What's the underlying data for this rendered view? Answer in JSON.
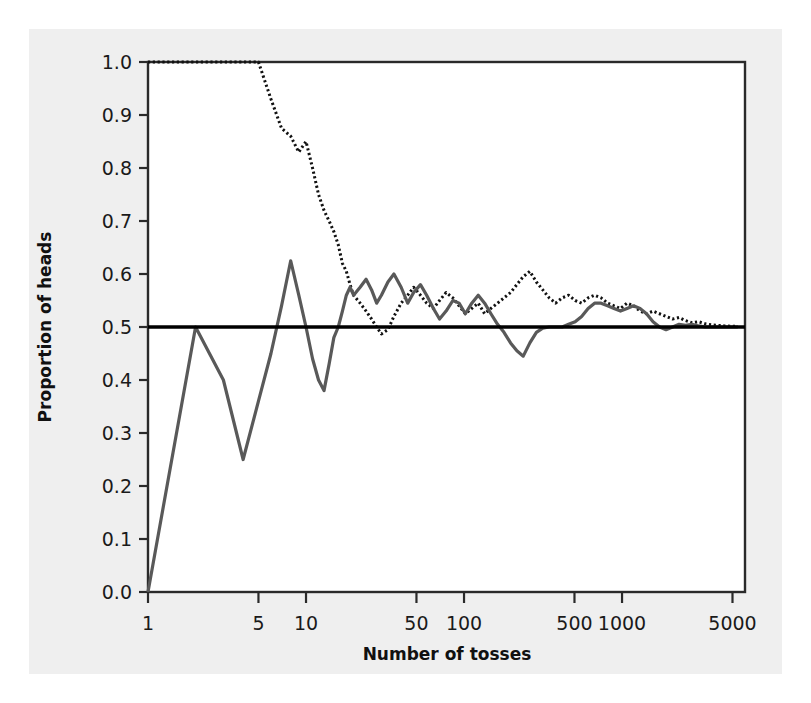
{
  "chart_data": {
    "type": "line",
    "title": "",
    "xlabel": "Number of tosses",
    "ylabel": "Proportion of heads",
    "xscale": "log",
    "xlim": [
      1,
      6000
    ],
    "ylim": [
      0.0,
      1.0
    ],
    "grid": false,
    "legend": "none",
    "xticks": [
      1,
      5,
      10,
      50,
      100,
      500,
      1000,
      5000
    ],
    "xtick_labels": [
      "1",
      "5",
      "10",
      "50",
      "100",
      "500",
      "1000",
      "5000"
    ],
    "yticks": [
      0.0,
      0.1,
      0.2,
      0.3,
      0.4,
      0.5,
      0.6,
      0.7,
      0.8,
      0.9,
      1.0
    ],
    "ytick_labels": [
      "0.0",
      "0.1",
      "0.2",
      "0.3",
      "0.4",
      "0.5",
      "0.6",
      "0.7",
      "0.8",
      "0.9",
      "1.0"
    ],
    "reference_line": {
      "name": "expected-proportion",
      "y": 0.5,
      "color": "#000000",
      "width": 3.5,
      "style": "solid"
    },
    "series": [
      {
        "name": "Trial A",
        "style": "dotted",
        "color": "#111111",
        "width": 3.0,
        "x": [
          1,
          2,
          3,
          4,
          5,
          6,
          7,
          8,
          9,
          10,
          11,
          12,
          13,
          14,
          15,
          16,
          17,
          18,
          19,
          20,
          22,
          24,
          26,
          28,
          30,
          33,
          36,
          40,
          44,
          48,
          53,
          58,
          64,
          70,
          77,
          85,
          93,
          102,
          112,
          123,
          135,
          148,
          163,
          179,
          197,
          216,
          237,
          261,
          287,
          315,
          346,
          380,
          418,
          459,
          505,
          555,
          610,
          670,
          737,
          810,
          890,
          978,
          1075,
          1182,
          1300,
          1429,
          1571,
          1727,
          1899,
          2088,
          2296,
          2525,
          2777,
          3054,
          3358,
          3692,
          4060,
          4464,
          4910,
          5400
        ],
        "y": [
          1.0,
          1.0,
          1.0,
          1.0,
          1.0,
          0.93,
          0.875,
          0.86,
          0.83,
          0.85,
          0.8,
          0.75,
          0.72,
          0.7,
          0.68,
          0.655,
          0.62,
          0.605,
          0.58,
          0.56,
          0.545,
          0.53,
          0.515,
          0.5,
          0.487,
          0.495,
          0.52,
          0.545,
          0.56,
          0.575,
          0.56,
          0.545,
          0.535,
          0.55,
          0.565,
          0.555,
          0.54,
          0.525,
          0.535,
          0.545,
          0.525,
          0.535,
          0.545,
          0.555,
          0.565,
          0.58,
          0.595,
          0.605,
          0.585,
          0.57,
          0.555,
          0.545,
          0.555,
          0.56,
          0.55,
          0.545,
          0.555,
          0.56,
          0.555,
          0.545,
          0.54,
          0.535,
          0.545,
          0.54,
          0.53,
          0.525,
          0.53,
          0.525,
          0.52,
          0.515,
          0.518,
          0.512,
          0.508,
          0.51,
          0.506,
          0.504,
          0.503,
          0.502,
          0.5015,
          0.501
        ]
      },
      {
        "name": "Trial B",
        "style": "solid",
        "color": "#595959",
        "width": 3.2,
        "x": [
          1,
          2,
          3,
          4,
          5,
          6,
          7,
          8,
          9,
          10,
          11,
          12,
          13,
          14,
          15,
          16,
          17,
          18,
          19,
          20,
          22,
          24,
          26,
          28,
          30,
          33,
          36,
          40,
          44,
          48,
          53,
          58,
          64,
          70,
          77,
          85,
          93,
          102,
          112,
          123,
          135,
          148,
          163,
          179,
          197,
          216,
          237,
          261,
          287,
          315,
          346,
          380,
          418,
          459,
          505,
          555,
          610,
          670,
          737,
          810,
          890,
          978,
          1075,
          1182,
          1300,
          1429,
          1571,
          1727,
          1899,
          2088,
          2296,
          2525,
          2777,
          3054,
          3358,
          3692,
          4060,
          4464,
          4910,
          5400
        ],
        "y": [
          0.0,
          0.5,
          0.4,
          0.25,
          0.36,
          0.45,
          0.54,
          0.625,
          0.56,
          0.5,
          0.44,
          0.4,
          0.38,
          0.43,
          0.48,
          0.5,
          0.53,
          0.56,
          0.575,
          0.56,
          0.575,
          0.59,
          0.57,
          0.545,
          0.56,
          0.585,
          0.6,
          0.575,
          0.545,
          0.565,
          0.58,
          0.56,
          0.535,
          0.515,
          0.53,
          0.55,
          0.545,
          0.525,
          0.545,
          0.56,
          0.545,
          0.525,
          0.505,
          0.49,
          0.47,
          0.455,
          0.445,
          0.47,
          0.49,
          0.498,
          0.5,
          0.5,
          0.5,
          0.505,
          0.51,
          0.52,
          0.535,
          0.545,
          0.545,
          0.54,
          0.535,
          0.53,
          0.535,
          0.54,
          0.535,
          0.525,
          0.51,
          0.5,
          0.495,
          0.5,
          0.505,
          0.503,
          0.505,
          0.502,
          0.5,
          0.5,
          0.5,
          0.5,
          0.5,
          0.5
        ]
      }
    ]
  },
  "axes": {
    "ylabel": "Proportion of heads",
    "xlabel": "Number of tosses"
  }
}
